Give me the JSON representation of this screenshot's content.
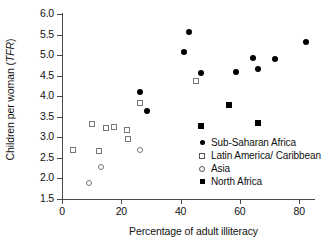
{
  "chart_data": {
    "type": "scatter",
    "title": "",
    "xlabel": "Percentage of adult illiteracy",
    "ylabel_prefix": "Children per woman (",
    "ylabel_italic": "TFR",
    "ylabel_suffix": ")",
    "xlim": [
      0,
      85
    ],
    "ylim": [
      1.5,
      6.0
    ],
    "xticks": [
      0,
      20,
      40,
      60,
      80
    ],
    "xtick_labels": [
      "0",
      "20",
      "40",
      "60",
      "80"
    ],
    "yticks": [
      1.5,
      2.0,
      2.5,
      3.0,
      3.5,
      4.0,
      4.5,
      5.0,
      5.5,
      6.0
    ],
    "ytick_labels": [
      "1.5",
      "2.0",
      "2.5",
      "3.0",
      "3.5",
      "4.0",
      "4.5",
      "5.0",
      "5.5",
      "6.0"
    ],
    "grid": false,
    "legend_position": "inside-lower-right",
    "series": [
      {
        "name": "Sub-Saharan Africa",
        "marker": "filled-circle",
        "color": "#000000",
        "points": [
          [
            26.2,
            4.1
          ],
          [
            28.8,
            3.65
          ],
          [
            41.2,
            5.07
          ],
          [
            42.8,
            5.56
          ],
          [
            46.8,
            4.56
          ],
          [
            58.8,
            4.6
          ],
          [
            64.4,
            4.93
          ],
          [
            66.0,
            4.67
          ],
          [
            71.8,
            4.9
          ],
          [
            82.2,
            5.32
          ]
        ]
      },
      {
        "name": "Latin America/Caribbean",
        "marker": "open-square",
        "color": "#777777",
        "points": [
          [
            3.8,
            2.68
          ],
          [
            10.2,
            3.32
          ],
          [
            12.6,
            2.67
          ],
          [
            15.0,
            3.22
          ],
          [
            17.6,
            3.26
          ],
          [
            21.8,
            3.17
          ],
          [
            22.2,
            2.95
          ],
          [
            26.4,
            3.83
          ],
          [
            45.2,
            4.37
          ]
        ]
      },
      {
        "name": "Asia",
        "marker": "open-circle",
        "color": "#777777",
        "points": [
          [
            9.2,
            1.9
          ],
          [
            13.0,
            2.27
          ],
          [
            26.2,
            2.68
          ]
        ]
      },
      {
        "name": "North Africa",
        "marker": "filled-square",
        "color": "#000000",
        "points": [
          [
            46.8,
            3.27
          ],
          [
            56.4,
            3.79
          ],
          [
            66.0,
            3.34
          ]
        ]
      }
    ]
  },
  "legend": {
    "items": [
      {
        "label": "Sub-Saharan Africa",
        "marker": "filled-circle"
      },
      {
        "label": "Latin America/ Caribbean",
        "marker": "open-square"
      },
      {
        "label": "Asia",
        "marker": "open-circle"
      },
      {
        "label": "North Africa",
        "marker": "filled-square"
      }
    ]
  }
}
